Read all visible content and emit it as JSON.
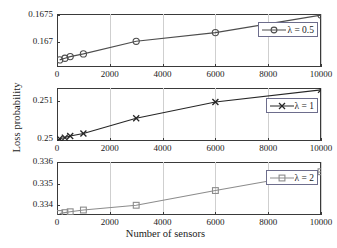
{
  "chart_data": {
    "type": "line",
    "title": "",
    "xlabel": "Number of sensors",
    "ylabel": "Loss probability",
    "xlim": [
      0,
      10000
    ],
    "xticks": [
      0,
      2000,
      4000,
      6000,
      8000,
      10000
    ],
    "xticklabels": [
      "0",
      "2000",
      "4000",
      "6000",
      "8000",
      "10000"
    ],
    "grid": true,
    "legend_position": "upper right",
    "layout": "3 stacked subplots sharing x-axis",
    "x": [
      100,
      300,
      500,
      1000,
      3000,
      6000,
      10000
    ],
    "panels": [
      {
        "id": "panel-lambda-05",
        "legend": "λ = 0.5",
        "marker": "circle",
        "color": "#4d4d4d",
        "ylim": [
          0.16655,
          0.16752
        ],
        "yticks": [
          0.167,
          0.1675
        ],
        "yticklabels": [
          "0.167",
          "0.1675"
        ],
        "values": [
          0.16668,
          0.16671,
          0.16674,
          0.16679,
          0.16702,
          0.16718,
          0.1675
        ]
      },
      {
        "id": "panel-lambda-1",
        "legend": "λ = 1",
        "marker": "x",
        "color": "#262626",
        "ylim": [
          0.24995,
          0.25135
        ],
        "yticks": [
          0.25,
          0.251
        ],
        "yticklabels": [
          "0.25",
          "0.251"
        ],
        "values": [
          0.25001,
          0.25004,
          0.25008,
          0.25015,
          0.25055,
          0.25098,
          0.2513
        ]
      },
      {
        "id": "panel-lambda-2",
        "legend": "λ = 2",
        "marker": "square",
        "color": "#8c8c8c",
        "ylim": [
          0.33355,
          0.336
        ],
        "yticks": [
          0.334,
          0.335,
          0.336
        ],
        "yticklabels": [
          "0.334",
          "0.335",
          "0.336"
        ],
        "values": [
          0.33362,
          0.33366,
          0.3337,
          0.33378,
          0.334,
          0.33468,
          0.33555
        ]
      }
    ]
  }
}
